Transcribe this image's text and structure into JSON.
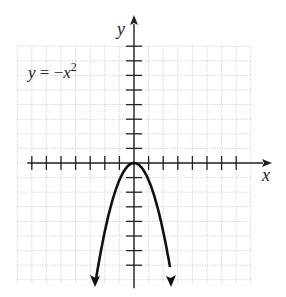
{
  "chart_data": {
    "type": "line",
    "title": "",
    "equation_label": {
      "lhs": "y",
      "eq": " = −",
      "var": "x",
      "exp": "2"
    },
    "xlabel": "x",
    "ylabel": "y",
    "xlim": [
      -8,
      8
    ],
    "ylim": [
      -8,
      8
    ],
    "grid": true,
    "x_ticks": [
      -7,
      -6,
      -5,
      -4,
      -3,
      -2,
      -1,
      1,
      2,
      3,
      4,
      5,
      6,
      7
    ],
    "y_ticks": [
      -7,
      -6,
      -5,
      -4,
      -3,
      -2,
      -1,
      1,
      2,
      3,
      4,
      5,
      6,
      7,
      8
    ],
    "series": [
      {
        "name": "y = -x^2",
        "x": [
          -2.6,
          -2,
          -1.5,
          -1,
          -0.5,
          0,
          0.5,
          1,
          1.5,
          2,
          2.6
        ],
        "y": [
          -7.9,
          -5.2,
          -3.2,
          -1.6,
          -0.5,
          0,
          -0.5,
          -1.6,
          -3.2,
          -5.2,
          -7.9
        ]
      }
    ]
  }
}
